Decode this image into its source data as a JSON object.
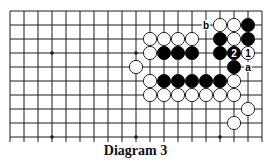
{
  "diagram": {
    "caption": "Diagram 3",
    "grid": {
      "origin_x": 10,
      "origin_y": 11,
      "spacing": 14,
      "columns": 19,
      "rows_visible": 10,
      "extend_below": 5
    },
    "colors": {
      "line": "#1a1a1a",
      "black_stone": "#000000",
      "white_stone": "#ffffff",
      "stone_edge": "#111111"
    },
    "star_points": [
      {
        "col": 3,
        "row": 3
      },
      {
        "col": 9,
        "row": 3
      },
      {
        "col": 3,
        "row": 9
      },
      {
        "col": 9,
        "row": 9
      },
      {
        "col": 15,
        "row": 9
      }
    ],
    "stones": [
      {
        "color": "white",
        "col": 15,
        "row": 1
      },
      {
        "color": "white",
        "col": 16,
        "row": 1
      },
      {
        "color": "black",
        "col": 17,
        "row": 1
      },
      {
        "color": "white",
        "col": 10,
        "row": 2
      },
      {
        "color": "white",
        "col": 11,
        "row": 2
      },
      {
        "color": "white",
        "col": 12,
        "row": 2
      },
      {
        "color": "white",
        "col": 13,
        "row": 2
      },
      {
        "color": "black",
        "col": 15,
        "row": 2
      },
      {
        "color": "white",
        "col": 16,
        "row": 2
      },
      {
        "color": "black",
        "col": 17,
        "row": 2
      },
      {
        "color": "white",
        "col": 10,
        "row": 3
      },
      {
        "color": "black",
        "col": 11,
        "row": 3
      },
      {
        "color": "black",
        "col": 12,
        "row": 3
      },
      {
        "color": "black",
        "col": 13,
        "row": 3
      },
      {
        "color": "black",
        "col": 15,
        "row": 3
      },
      {
        "color": "black",
        "col": 16,
        "row": 3,
        "label": "2"
      },
      {
        "color": "white",
        "col": 17,
        "row": 3,
        "label": "1"
      },
      {
        "color": "white",
        "col": 9,
        "row": 4
      },
      {
        "color": "black",
        "col": 16,
        "row": 4
      },
      {
        "color": "white",
        "col": 10,
        "row": 5
      },
      {
        "color": "black",
        "col": 11,
        "row": 5
      },
      {
        "color": "black",
        "col": 12,
        "row": 5
      },
      {
        "color": "black",
        "col": 13,
        "row": 5
      },
      {
        "color": "black",
        "col": 14,
        "row": 5
      },
      {
        "color": "black",
        "col": 15,
        "row": 5
      },
      {
        "color": "white",
        "col": 16,
        "row": 5
      },
      {
        "color": "white",
        "col": 10,
        "row": 6
      },
      {
        "color": "white",
        "col": 11,
        "row": 6
      },
      {
        "color": "white",
        "col": 12,
        "row": 6
      },
      {
        "color": "white",
        "col": 13,
        "row": 6
      },
      {
        "color": "white",
        "col": 14,
        "row": 6
      },
      {
        "color": "white",
        "col": 15,
        "row": 6
      },
      {
        "color": "white",
        "col": 16,
        "row": 6
      },
      {
        "color": "white",
        "col": 17,
        "row": 7
      },
      {
        "color": "white",
        "col": 16,
        "row": 8
      }
    ],
    "point_labels": [
      {
        "text": "b",
        "col": 14,
        "row": 1
      },
      {
        "text": "a",
        "col": 17,
        "row": 4
      }
    ]
  }
}
